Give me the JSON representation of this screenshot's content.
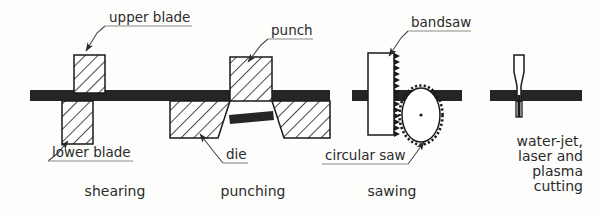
{
  "figure": {
    "title_visible": false,
    "background_color": "#fdfdfb",
    "ink_color": "#1a1a1a",
    "workpiece_color": "#252525",
    "label_color": "#2b2b2b"
  },
  "panels": [
    {
      "id": "shearing",
      "caption": "shearing",
      "caption_x": 115,
      "caption_y": 196,
      "labels": [
        {
          "key": "upper_blade",
          "text": "upper blade",
          "x": 109,
          "y": 22,
          "underline": [
            105,
            26,
            192,
            26
          ]
        },
        {
          "key": "lower_blade",
          "text": "lower blade",
          "x": 52,
          "y": 157,
          "underline": [
            48,
            161,
            133,
            161
          ]
        }
      ],
      "parts": [
        "upper blade",
        "lower blade",
        "workpiece"
      ]
    },
    {
      "id": "punching",
      "caption": "punching",
      "caption_x": 253,
      "caption_y": 196,
      "labels": [
        {
          "key": "punch",
          "text": "punch",
          "x": 271,
          "y": 35,
          "underline": [
            268,
            39,
            313,
            39
          ]
        },
        {
          "key": "die",
          "text": "die",
          "x": 226,
          "y": 159,
          "underline": [
            223,
            163,
            248,
            163
          ]
        }
      ],
      "parts": [
        "punch",
        "die",
        "workpiece",
        "slug"
      ]
    },
    {
      "id": "sawing",
      "caption": "sawing",
      "caption_x": 392,
      "caption_y": 196,
      "labels": [
        {
          "key": "bandsaw",
          "text": "bandsaw",
          "x": 411,
          "y": 27,
          "underline": [
            408,
            31,
            471,
            31
          ]
        },
        {
          "key": "circular_saw",
          "text": "circular saw",
          "x": 325,
          "y": 160,
          "underline": [
            322,
            164,
            408,
            164
          ]
        }
      ],
      "parts": [
        "bandsaw",
        "circular saw",
        "workpiece"
      ]
    },
    {
      "id": "beam-cutting",
      "caption_lines": [
        "water-jet,",
        "laser and",
        "plasma",
        "cutting"
      ],
      "caption_x": 583,
      "caption_y": 155,
      "caption_line_height": 15,
      "labels": [],
      "parts": [
        "nozzle",
        "beam",
        "workpiece"
      ]
    }
  ]
}
